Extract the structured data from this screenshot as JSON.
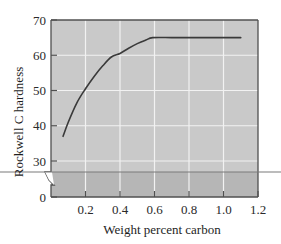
{
  "chart_data": {
    "type": "line",
    "title": "",
    "xlabel": "Weight percent carbon",
    "ylabel": "Rockwell C hardness",
    "xlim": [
      0,
      1.2
    ],
    "ylim": [
      0,
      70
    ],
    "y_axis_break": {
      "from": 0,
      "to": 30,
      "note": "broken axis between 0 and 30"
    },
    "x_ticks": [
      0.2,
      0.4,
      0.6,
      0.8,
      1.0,
      1.2
    ],
    "x_tick_labels": [
      "0.2",
      "0.4",
      "0.6",
      "0.8",
      "1.0",
      "1.2"
    ],
    "y_ticks": [
      0,
      30,
      40,
      50,
      60,
      70
    ],
    "y_tick_labels": [
      "0",
      "30",
      "40",
      "50",
      "60",
      "70"
    ],
    "grid": true,
    "legend": null,
    "series": [
      {
        "name": "Hardness vs carbon",
        "x": [
          0.07,
          0.1,
          0.15,
          0.2,
          0.25,
          0.3,
          0.35,
          0.4,
          0.45,
          0.5,
          0.55,
          0.59,
          0.7,
          0.8,
          0.9,
          1.0,
          1.1
        ],
        "values": [
          37,
          41,
          46.5,
          50.5,
          54,
          57,
          59.5,
          60.5,
          62,
          63.3,
          64.3,
          65,
          65,
          65,
          65,
          65,
          65
        ]
      }
    ]
  },
  "colors": {
    "plot_fill_upper": "#c9c9c9",
    "plot_fill_lower": "#b6b6b6",
    "grid": "#f2f2f2",
    "frame": "#505050",
    "curve": "#3a3a3a",
    "break_line": "#7a7a7a"
  }
}
